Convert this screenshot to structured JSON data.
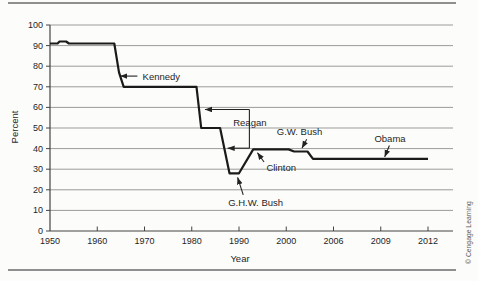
{
  "page": {
    "copyright": "© Cengage Learning"
  },
  "chart_data": {
    "type": "line",
    "title": "",
    "xlabel": "Year",
    "ylabel": "Percent",
    "x_scale": "piecewise-equal-tick-spacing",
    "x_ticks": [
      1950,
      1960,
      1970,
      1980,
      1990,
      2000,
      2006,
      2009,
      2012
    ],
    "y_ticks": [
      0,
      10,
      20,
      30,
      40,
      50,
      60,
      70,
      80,
      90,
      100
    ],
    "ylim": [
      0,
      100
    ],
    "grid": "horizontal",
    "grid_color": "#9b9b9b",
    "axis_color": "#444444",
    "series": [
      {
        "name": "Top marginal income tax rate",
        "color": "#1a1a1a",
        "points": [
          [
            1950,
            91
          ],
          [
            1951.6,
            91
          ],
          [
            1952,
            92
          ],
          [
            1953.4,
            92
          ],
          [
            1954,
            91
          ],
          [
            1963.6,
            91
          ],
          [
            1964.6,
            77
          ],
          [
            1965.6,
            70
          ],
          [
            1981,
            70
          ],
          [
            1982,
            50
          ],
          [
            1986,
            50
          ],
          [
            1988,
            28
          ],
          [
            1990,
            28
          ],
          [
            1993,
            39.6
          ],
          [
            2000.3,
            39.6
          ],
          [
            2001,
            38.6
          ],
          [
            2002.7,
            38.6
          ],
          [
            2003.4,
            35
          ],
          [
            2012,
            35
          ]
        ]
      }
    ],
    "annotations": [
      {
        "id": "kennedy",
        "label": "Kennedy",
        "label_year": 1969.6,
        "label_pct": 75.2,
        "anchor": "start",
        "tail_year": 1968.5,
        "tail_pct": 75.2,
        "tip_year": 1964.9,
        "tip_pct": 75.2
      },
      {
        "id": "clinton",
        "label": "Clinton",
        "label_year": 1995.8,
        "label_pct": 30.8,
        "anchor": "start",
        "tail_year": 1995.3,
        "tail_pct": 33.5,
        "tip_year": 1993.9,
        "tip_pct": 38.0
      },
      {
        "id": "ghw-bush",
        "label": "G.H.W. Bush",
        "label_year": 1987.7,
        "label_pct": 13.8,
        "anchor": "start",
        "tail_year": 1990.9,
        "tail_pct": 17.5,
        "tip_year": 1989.7,
        "tip_pct": 26.0
      },
      {
        "id": "gw-bush",
        "label": "G.W. Bush",
        "label_year": 1998.0,
        "label_pct": 48.2,
        "anchor": "start",
        "tail_year": 2002.6,
        "tail_pct": 44.5,
        "tip_year": 2002.0,
        "tip_pct": 40.3
      },
      {
        "id": "obama",
        "label": "Obama",
        "label_year": 2008.6,
        "label_pct": 45.0,
        "anchor": "start",
        "tail_year": 2009.55,
        "tail_pct": 41.5,
        "tip_year": 2009.25,
        "tip_pct": 36.0
      }
    ],
    "bracket": {
      "id": "reagan",
      "label": "Reagan",
      "label_year": 1992.3,
      "label_pct": 52.6,
      "x_year": 1992.2,
      "top_pct": 59,
      "bottom_pct": 40.2,
      "top_tip_year": 1982.8,
      "bottom_tip_year": 1987.6
    }
  }
}
